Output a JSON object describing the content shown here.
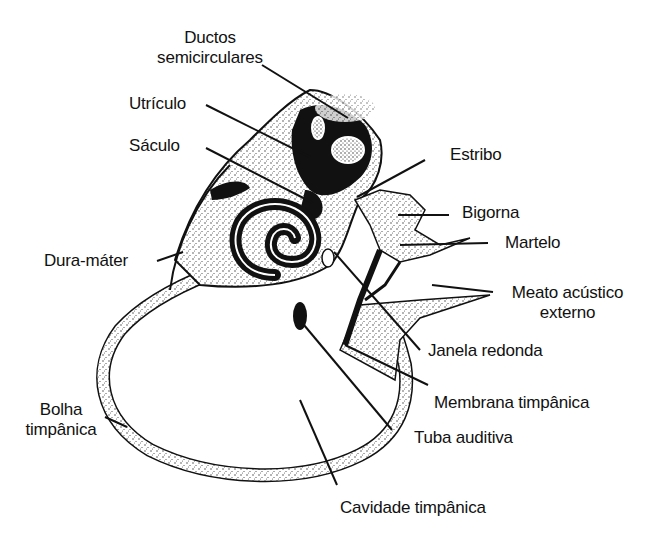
{
  "figure": {
    "colors": {
      "ink": "#111111",
      "background": "#ffffff",
      "stipple": "#555555"
    }
  },
  "labels": {
    "ductos_line1": "Ductos",
    "ductos_line2": "semicirculares",
    "utriculo": "Utrículo",
    "saculo": "Sáculo",
    "dura_mater": "Dura-máter",
    "estribo": "Estribo",
    "bigorna": "Bigorna",
    "martelo": "Martelo",
    "meato_line1": "Meato acústico",
    "meato_line2": "externo",
    "janela_redonda": "Janela redonda",
    "membrana_timpanica": "Membrana timpânica",
    "tuba_auditiva": "Tuba auditiva",
    "bolha_line1": "Bolha",
    "bolha_line2": "timpânica",
    "cavidade_timpanica": "Cavidade timpânica"
  }
}
